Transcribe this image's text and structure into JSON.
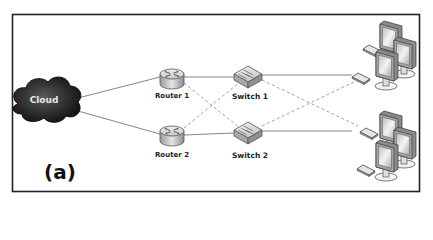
{
  "figure": {
    "caption": "(a)",
    "border_color": "#222222",
    "link_color": "#777777",
    "dashed_link_color": "#888888"
  },
  "nodes": {
    "cloud": {
      "label": "Cloud",
      "color": "#2a2a2a"
    },
    "router1": {
      "label": "Router 1"
    },
    "router2": {
      "label": "Router 2"
    },
    "switch1": {
      "label": "Switch 1"
    },
    "switch2": {
      "label": "Switch 2"
    },
    "workstations1": {
      "label": ""
    },
    "workstations2": {
      "label": ""
    }
  },
  "links": {
    "solid": [
      [
        "cloud",
        "router1"
      ],
      [
        "cloud",
        "router2"
      ],
      [
        "router1",
        "switch1"
      ],
      [
        "router2",
        "switch2"
      ],
      [
        "switch1",
        "workstations1"
      ],
      [
        "switch2",
        "workstations2"
      ]
    ],
    "dashed": [
      [
        "router1",
        "switch2"
      ],
      [
        "router2",
        "switch1"
      ],
      [
        "switch1",
        "workstations2"
      ],
      [
        "switch2",
        "workstations1"
      ]
    ]
  }
}
